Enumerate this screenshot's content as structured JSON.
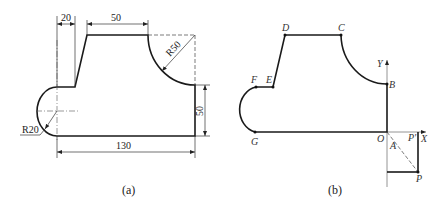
{
  "figure_a": {
    "caption": "(a)",
    "dimensions": {
      "step_width": "20",
      "top_length": "50",
      "arc_radius": "R50",
      "right_height": "50",
      "left_radius": "R20",
      "total_length": "130"
    }
  },
  "figure_b": {
    "caption": "(b)",
    "points": {
      "D": "D",
      "C": "C",
      "F": "F",
      "E": "E",
      "B": "B",
      "G": "G",
      "O": "O",
      "P_prime": "P'",
      "A": "A",
      "P": "P"
    },
    "axes": {
      "x": "X",
      "y": "Y"
    }
  }
}
